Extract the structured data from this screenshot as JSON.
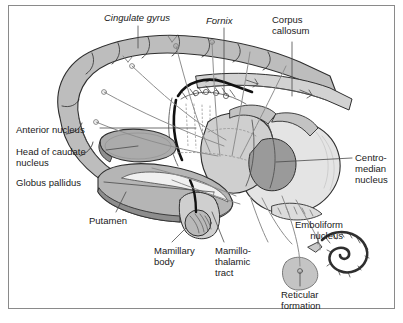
{
  "figure": {
    "background_color": "#ffffff",
    "frame_color": "#8a8a8a",
    "label_color": "#1a1a1a",
    "palette": {
      "cortex_gray": "#bdbdbd",
      "caudate_gray": "#ababab",
      "pallidus_gray": "#b5b5b5",
      "thalamus_light": "#cfcfcf",
      "thalamus_mid": "#b0b0b0",
      "thalamus_dark": "#9a9a9a",
      "corpus_callosum": "#d2d2d2",
      "reticular_gray": "#c4c4c4",
      "outline": "#3a3a3a",
      "fiber_gray": "#8e8e8e"
    }
  },
  "labels": [
    {
      "id": "cingulate-gyrus",
      "text": "Cingulate gyrus",
      "style": "italic",
      "align": "left",
      "x": 104,
      "y": 12
    },
    {
      "id": "fornix",
      "text": "Fornix",
      "style": "italic",
      "align": "left",
      "x": 206,
      "y": 15
    },
    {
      "id": "corpus-callosum",
      "text": "Corpus\ncallosum",
      "style": "normal",
      "align": "left",
      "x": 272,
      "y": 14
    },
    {
      "id": "anterior-nucleus",
      "text": "Anterior nucleus",
      "style": "normal",
      "align": "left",
      "x": 16,
      "y": 124
    },
    {
      "id": "head-of-caudate",
      "text": "Head of caudate\nnucleus",
      "style": "normal",
      "align": "left",
      "x": 16,
      "y": 146
    },
    {
      "id": "globus-pallidus",
      "text": "Globus pallidus",
      "style": "normal",
      "align": "left",
      "x": 16,
      "y": 177
    },
    {
      "id": "putamen",
      "text": "Putamen",
      "style": "normal",
      "align": "left",
      "x": 89,
      "y": 215
    },
    {
      "id": "mamillary-body",
      "text": "Mamillary\nbody",
      "style": "normal",
      "align": "left",
      "x": 154,
      "y": 245
    },
    {
      "id": "mamillothalamic",
      "text": "Mamillo-\nthalamic\ntract",
      "style": "normal",
      "align": "left",
      "x": 215,
      "y": 245
    },
    {
      "id": "centromedian",
      "text": "Centro-\nmedian\nnucleus",
      "style": "normal",
      "align": "left",
      "x": 355,
      "y": 152
    },
    {
      "id": "emboliform",
      "text": "Emboliform\nnucleus",
      "style": "normal",
      "align": "right",
      "x": 343,
      "y": 219
    },
    {
      "id": "reticular-formation",
      "text": "Reticular\nformation",
      "style": "normal",
      "align": "left",
      "x": 281,
      "y": 289
    }
  ]
}
